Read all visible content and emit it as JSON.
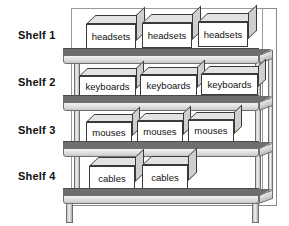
{
  "diagram": {
    "background_color": "#ffffff",
    "shelf_deck_color": "#6e6e6e",
    "shelf_front_color": "#e4e4e4",
    "carton_face_color": "#ffffff",
    "carton_top_color": "#e3e3e3",
    "carton_side_color": "#cfcfcf",
    "outline_color": "#3a3a3a"
  },
  "shelves": [
    {
      "label": "Shelf 1",
      "item": "headsets",
      "count": 3,
      "boxes": [
        {
          "label": "headsets"
        },
        {
          "label": "headsets"
        },
        {
          "label": "headsets"
        }
      ]
    },
    {
      "label": "Shelf 2",
      "item": "keyboards",
      "count": 3,
      "boxes": [
        {
          "label": "keyboards"
        },
        {
          "label": "keyboards"
        },
        {
          "label": "keyboards"
        }
      ]
    },
    {
      "label": "Shelf 3",
      "item": "mouses",
      "count": 3,
      "boxes": [
        {
          "label": "mouses"
        },
        {
          "label": "mouses"
        },
        {
          "label": "mouses"
        }
      ]
    },
    {
      "label": "Shelf 4",
      "item": "cables",
      "count": 2,
      "boxes": [
        {
          "label": "cables"
        },
        {
          "label": "cables"
        }
      ]
    }
  ]
}
